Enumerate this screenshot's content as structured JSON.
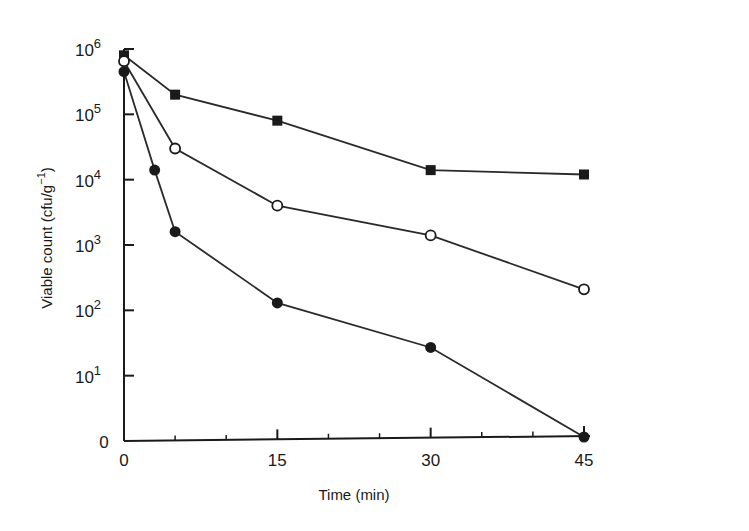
{
  "chart_data": {
    "type": "line",
    "title": "",
    "xlabel": "Time (min)",
    "ylabel": "Viable count (cfu/g⁻¹)",
    "yscale": "log",
    "xlim": [
      0,
      45
    ],
    "ylim": [
      1,
      1000000
    ],
    "x_ticks": [
      0,
      15,
      30,
      45
    ],
    "x_minor_ticks": [
      5,
      10,
      20,
      25,
      35,
      40
    ],
    "y_ticks": [
      {
        "label": "0",
        "exp": 0
      },
      {
        "label": "10",
        "sup": "1",
        "exp": 1
      },
      {
        "label": "10",
        "sup": "2",
        "exp": 2
      },
      {
        "label": "10",
        "sup": "3",
        "exp": 3
      },
      {
        "label": "10",
        "sup": "4",
        "exp": 4
      },
      {
        "label": "10",
        "sup": "5",
        "exp": 5
      },
      {
        "label": "10",
        "sup": "6",
        "exp": 6
      }
    ],
    "grid": false,
    "legend": null,
    "series": [
      {
        "name": "filled squares",
        "marker": "square-filled",
        "x": [
          0,
          5,
          15,
          30,
          45
        ],
        "values": [
          800000,
          200000,
          80000,
          14000,
          12000
        ]
      },
      {
        "name": "open circles",
        "marker": "circle-open",
        "x": [
          0,
          5,
          15,
          30,
          45
        ],
        "values": [
          650000,
          30000,
          4000,
          1400,
          210
        ]
      },
      {
        "name": "filled circles",
        "marker": "circle-filled",
        "x": [
          0,
          3,
          5,
          15,
          30,
          45
        ],
        "values": [
          450000,
          14000,
          1600,
          130,
          27,
          0
        ]
      }
    ]
  },
  "labels": {
    "xlabel": "Time (min)",
    "ylabel_main": "Viable count (cfu/g",
    "ylabel_sup": "−1",
    "ylabel_end": ")"
  }
}
